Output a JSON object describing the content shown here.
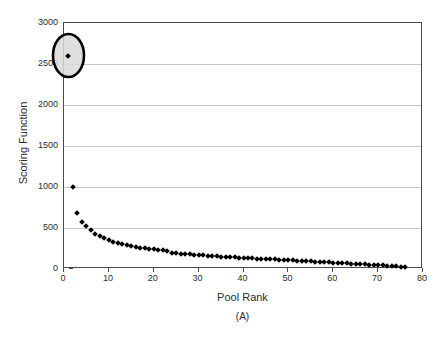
{
  "chart_data": {
    "type": "scatter",
    "title": "",
    "xlabel": "Pool Rank",
    "ylabel": "Scoring Function",
    "caption": "(A)",
    "xlim": [
      0,
      80
    ],
    "ylim": [
      0,
      3000
    ],
    "xticks": [
      0,
      10,
      20,
      30,
      40,
      50,
      60,
      70,
      80
    ],
    "yticks": [
      0,
      500,
      1000,
      1500,
      2000,
      2500,
      3000
    ],
    "grid": "horizontal",
    "legend": "none",
    "marker": "diamond",
    "marker_color": "#000000",
    "x": [
      1,
      2,
      3,
      4,
      5,
      6,
      7,
      8,
      9,
      10,
      11,
      12,
      13,
      14,
      15,
      16,
      17,
      18,
      19,
      20,
      21,
      22,
      23,
      24,
      25,
      26,
      27,
      28,
      29,
      30,
      31,
      32,
      33,
      34,
      35,
      36,
      37,
      38,
      39,
      40,
      41,
      42,
      43,
      44,
      45,
      46,
      47,
      48,
      49,
      50,
      51,
      52,
      53,
      54,
      55,
      56,
      57,
      58,
      59,
      60,
      61,
      62,
      63,
      64,
      65,
      66,
      67,
      68,
      69,
      70,
      71,
      72,
      73,
      74,
      75,
      76
    ],
    "values": [
      2600,
      1000,
      680,
      570,
      530,
      470,
      430,
      400,
      375,
      350,
      330,
      315,
      300,
      290,
      280,
      270,
      262,
      255,
      248,
      242,
      236,
      230,
      222,
      200,
      192,
      188,
      184,
      180,
      176,
      172,
      168,
      164,
      160,
      156,
      152,
      149,
      146,
      143,
      140,
      137,
      134,
      131,
      128,
      125,
      122,
      119,
      116,
      113,
      110,
      107,
      104,
      101,
      98,
      95,
      92,
      89,
      86,
      83,
      80,
      77,
      74,
      71,
      68,
      65,
      62,
      59,
      56,
      53,
      50,
      47,
      44,
      41,
      38,
      34,
      30,
      22
    ],
    "annotations": [
      {
        "type": "ellipse",
        "name": "highlight-ellipse",
        "x": 1,
        "y": 2600,
        "width_px": 31,
        "height_px": 43,
        "stroke": "#000000",
        "fill": "#d9d9d9"
      }
    ],
    "axis_color": "#4a4a4a",
    "grid_color": "#c8c8c8"
  }
}
